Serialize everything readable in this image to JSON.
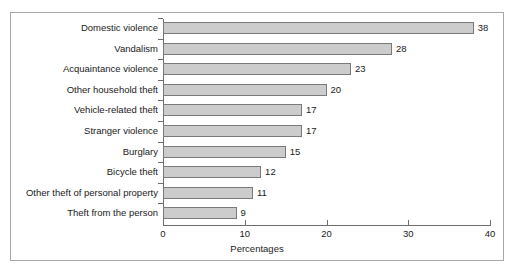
{
  "chart_data": {
    "type": "bar",
    "orientation": "horizontal",
    "title": "",
    "xlabel": "Percentages",
    "ylabel": "",
    "xlim": [
      0,
      40
    ],
    "xticks": [
      0,
      10,
      20,
      30,
      40
    ],
    "xtick_labels": [
      "0",
      "10",
      "20",
      "30",
      "40"
    ],
    "grid": false,
    "legend": false,
    "categories": [
      "Domestic violence",
      "Vandalism",
      "Acquaintance violence",
      "Other household theft",
      "Vehicle-related theft",
      "Stranger violence",
      "Burglary",
      "Bicycle theft",
      "Other theft of personal property",
      "Theft from the person"
    ],
    "values": [
      38,
      28,
      23,
      20,
      17,
      17,
      15,
      12,
      11,
      9
    ],
    "value_labels": [
      "38",
      "28",
      "23",
      "20",
      "17",
      "17",
      "15",
      "12",
      "11",
      "9"
    ],
    "bar_fill_color": "#cccccc",
    "bar_edge_color": "#7a7a7a",
    "axis_color": "#6e6e6e",
    "text_color": "#1a1a1a",
    "frame_border_color": "#a8a8a8",
    "background_color": "#ffffff"
  }
}
